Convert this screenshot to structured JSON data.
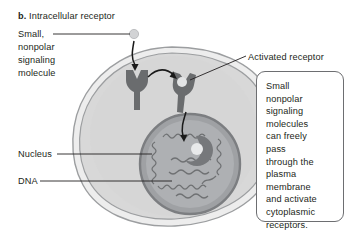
{
  "figure": {
    "panel_letter": "b.",
    "title": "Intracellular receptor"
  },
  "labels": {
    "signaling_molecule": "Small,\nnonpolar\nsignaling\nmolecule",
    "activated_receptor": "Activated receptor",
    "nucleus": "Nucleus",
    "dna": "DNA"
  },
  "callout": {
    "text": "Small\nnonpolar\nsignaling\nmolecules\ncan freely\npass\nthrough the\nplasma\nmembrane\nand activate\ncytoplasmic\nreceptors."
  },
  "diagram": {
    "type": "cell-signaling-illustration",
    "elements": [
      "signaling-molecule-sphere",
      "plasma-membrane",
      "cytoplasm",
      "unbound-intracellular-receptor",
      "activated-receptor-with-ligand",
      "nucleus",
      "dna-strand",
      "nuclear-receptor-complex"
    ]
  },
  "colors": {
    "text": "#231f20",
    "membrane_outline": "#8a8c8e",
    "cytoplasm": "#d9d9d9",
    "nucleus_fill": "#a8a9ad",
    "nucleus_ring": "#808285",
    "receptor": "#6a6c6e",
    "molecule": "#d4d5d7",
    "arrow": "#1a1a1a",
    "callout_border": "#6d6e71"
  }
}
